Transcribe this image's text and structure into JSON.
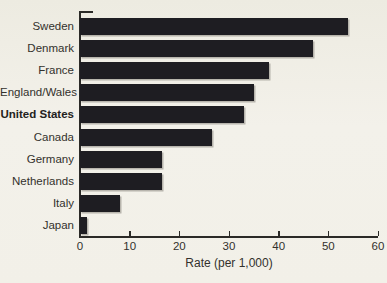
{
  "chart_data": {
    "type": "bar",
    "orientation": "horizontal",
    "title": "",
    "xlabel": "Rate (per 1,000)",
    "ylabel": "",
    "xlim": [
      0,
      60
    ],
    "xticks": [
      0,
      10,
      20,
      30,
      40,
      50,
      60
    ],
    "grid": false,
    "legend": false,
    "categories": [
      "Sweden",
      "Denmark",
      "France",
      "England/Wales",
      "United States",
      "Canada",
      "Germany",
      "Netherlands",
      "Italy",
      "Japan"
    ],
    "values": [
      54,
      47,
      38,
      35,
      33,
      26.5,
      16.5,
      16.5,
      8,
      1.5
    ],
    "emphasized_category": "United States",
    "bar_color": "#1e1d22",
    "background_color": "#f1efe7",
    "axis_color": "#2b2a27"
  }
}
